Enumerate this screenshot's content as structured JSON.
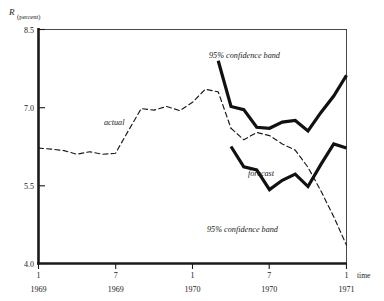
{
  "chart_data": {
    "type": "line",
    "title": "",
    "ylabel": "R",
    "ylabel_unit": "(percent)",
    "xlabel": "time",
    "ylim": [
      4.0,
      8.5
    ],
    "yticks": [
      "4.0",
      "5.5",
      "7.0",
      "8.5"
    ],
    "ytick_values": [
      4.0,
      5.5,
      7.0,
      8.5
    ],
    "grid": false,
    "legend_position": "inline-annotations",
    "xticks": [
      {
        "top": "1",
        "bottom": "1969"
      },
      {
        "top": "7",
        "bottom": "1969"
      },
      {
        "top": "1",
        "bottom": "1970"
      },
      {
        "top": "7",
        "bottom": "1970"
      },
      {
        "top": "1",
        "bottom": "1971"
      }
    ],
    "xlim": [
      "1969-01",
      "1971-01"
    ],
    "annotations": [
      {
        "text": "actual",
        "x": 1969.42,
        "y": 6.75
      },
      {
        "text": "95% confidence band",
        "x": 1970.12,
        "y": 7.75
      },
      {
        "text": "forecast",
        "x": 1970.38,
        "y": 5.95
      },
      {
        "text": "95% confidence band",
        "x": 1970.12,
        "y": 4.95
      }
    ],
    "series": [
      {
        "name": "actual",
        "style": "dashed",
        "x": [
          1969.0,
          1969.083,
          1969.167,
          1969.25,
          1969.333,
          1969.417,
          1969.5,
          1969.583,
          1969.667,
          1969.75,
          1969.833,
          1969.917,
          1970.0,
          1970.083,
          1970.167,
          1970.25
        ],
        "values": [
          6.22,
          6.2,
          6.17,
          6.1,
          6.15,
          6.1,
          6.12,
          6.55,
          6.98,
          6.95,
          7.02,
          6.94,
          7.1,
          7.35,
          7.3,
          6.6
        ]
      },
      {
        "name": "forecast",
        "style": "dashed",
        "x": [
          1970.25,
          1970.333,
          1970.417,
          1970.5,
          1970.583,
          1970.667,
          1970.75,
          1970.833,
          1970.917,
          1971.0
        ],
        "values": [
          6.6,
          6.38,
          6.52,
          6.46,
          6.3,
          6.18,
          5.85,
          5.4,
          4.9,
          4.35
        ]
      },
      {
        "name": "95% confidence band upper",
        "style": "solid-bold",
        "x": [
          1970.167,
          1970.25,
          1970.333,
          1970.417,
          1970.5,
          1970.583,
          1970.667,
          1970.75,
          1970.833,
          1970.917,
          1971.0
        ],
        "values": [
          7.9,
          7.02,
          6.96,
          6.62,
          6.6,
          6.72,
          6.75,
          6.55,
          6.9,
          7.22,
          7.62
        ]
      },
      {
        "name": "95% confidence band lower",
        "style": "solid-bold",
        "x": [
          1970.25,
          1970.333,
          1970.417,
          1970.5,
          1970.583,
          1970.667,
          1970.75,
          1970.833,
          1970.917,
          1971.0
        ],
        "values": [
          6.25,
          5.86,
          5.8,
          5.42,
          5.6,
          5.72,
          5.48,
          5.9,
          6.3,
          6.22
        ]
      }
    ]
  },
  "axes": {
    "y_title": "R",
    "y_title_unit": "(percent)",
    "x_title": "time"
  }
}
